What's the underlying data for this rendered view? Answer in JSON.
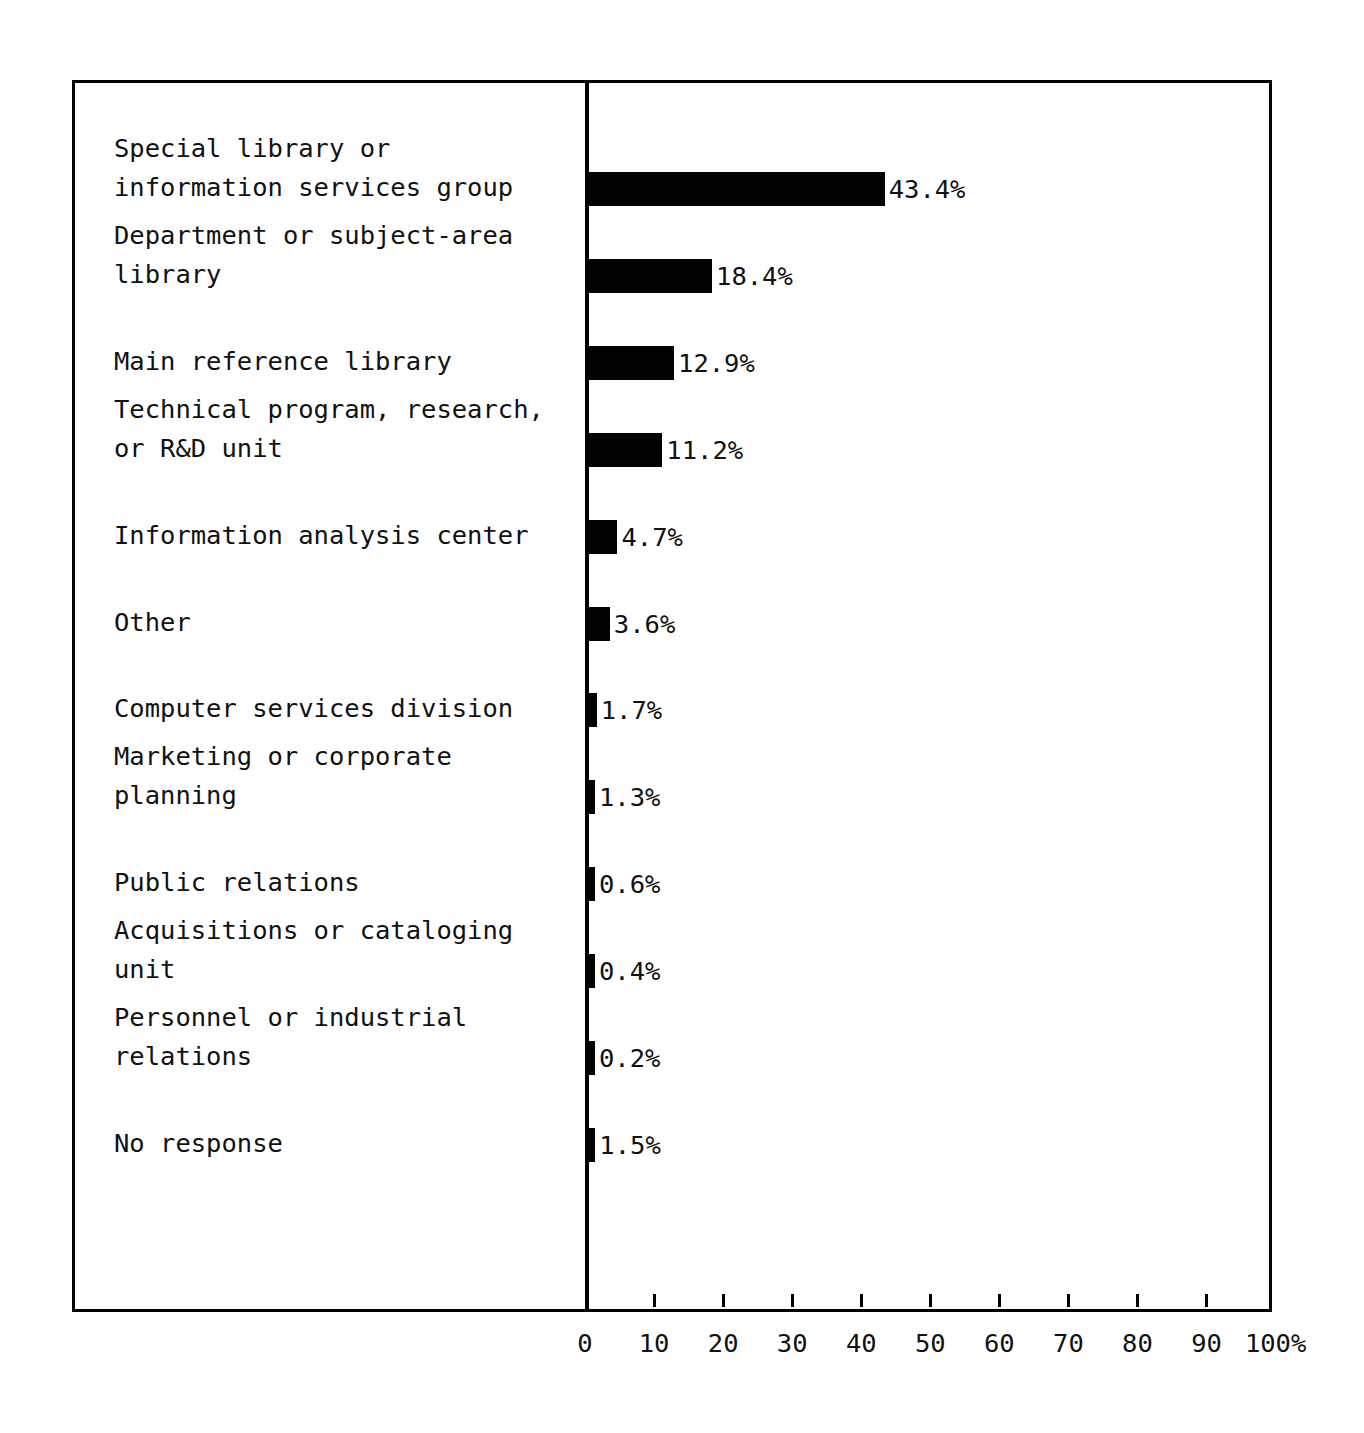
{
  "chart_data": {
    "type": "bar",
    "orientation": "horizontal",
    "title": "",
    "xlabel": "",
    "ylabel": "",
    "xlim": [
      0,
      100
    ],
    "grid": false,
    "legend": null,
    "value_suffix": "%",
    "axis_unit_label": "100%",
    "categories": [
      "Special library or\ninformation services group",
      "Department or subject-area\nlibrary",
      "Main reference library",
      "Technical program, research,\nor R&D unit",
      "Information analysis center",
      "Other",
      "Computer services division",
      "Marketing or corporate\nplanning",
      "Public relations",
      "Acquisitions or cataloging\nunit",
      "Personnel or industrial\nrelations",
      "No response"
    ],
    "values": [
      43.4,
      18.4,
      12.9,
      11.2,
      4.7,
      3.6,
      1.7,
      1.3,
      0.6,
      0.4,
      0.2,
      1.5
    ],
    "value_labels": [
      "43.4%",
      "18.4%",
      "12.9%",
      "11.2%",
      "4.7%",
      "3.6%",
      "1.7%",
      "1.3%",
      "0.6%",
      "0.4%",
      "0.2%",
      "1.5%"
    ],
    "xticks": [
      0,
      10,
      20,
      30,
      40,
      50,
      60,
      70,
      80,
      90,
      100
    ],
    "xtick_labels": [
      "0",
      "10",
      "20",
      "30",
      "40",
      "50",
      "60",
      "70",
      "80",
      "90",
      "100%"
    ],
    "bar_color": "#000000",
    "frame_color": "#000000",
    "background_color": "#ffffff"
  },
  "rows": [
    {
      "label_line1": "Special library or",
      "label_line2": "information services group",
      "value_label": "43.4%",
      "value": 43.4
    },
    {
      "label_line1": "Department or subject-area",
      "label_line2": "library",
      "value_label": "18.4%",
      "value": 18.4
    },
    {
      "label_line1": "Main reference library",
      "label_line2": "",
      "value_label": "12.9%",
      "value": 12.9
    },
    {
      "label_line1": "Technical program, research,",
      "label_line2": "or R&D unit",
      "value_label": "11.2%",
      "value": 11.2
    },
    {
      "label_line1": "Information analysis center",
      "label_line2": "",
      "value_label": "4.7%",
      "value": 4.7
    },
    {
      "label_line1": "Other",
      "label_line2": "",
      "value_label": "3.6%",
      "value": 3.6
    },
    {
      "label_line1": "Computer services division",
      "label_line2": "",
      "value_label": "1.7%",
      "value": 1.7
    },
    {
      "label_line1": "Marketing or corporate",
      "label_line2": "planning",
      "value_label": "1.3%",
      "value": 1.3
    },
    {
      "label_line1": "Public relations",
      "label_line2": "",
      "value_label": "0.6%",
      "value": 0.6
    },
    {
      "label_line1": "Acquisitions or cataloging",
      "label_line2": "unit",
      "value_label": "0.4%",
      "value": 0.4
    },
    {
      "label_line1": "Personnel or industrial",
      "label_line2": "relations",
      "value_label": "0.2%",
      "value": 0.2
    },
    {
      "label_line1": "No response",
      "label_line2": "",
      "value_label": "1.5%",
      "value": 1.5
    }
  ],
  "axis": {
    "tick_labels": [
      "0",
      "10",
      "20",
      "30",
      "40",
      "50",
      "60",
      "70",
      "80",
      "90",
      "100%"
    ]
  }
}
